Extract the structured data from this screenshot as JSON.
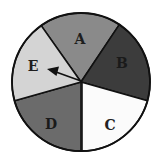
{
  "spinner": {
    "sectors": [
      {
        "label": "A",
        "color": "#8a8a8a",
        "label_color": "#1e1e1e"
      },
      {
        "label": "B",
        "color": "#3c3c3c",
        "label_color": "#1a1a1a"
      },
      {
        "label": "C",
        "color": "#fbfbfb",
        "label_color": "#222222"
      },
      {
        "label": "D",
        "color": "#6b6b6b",
        "label_color": "#1a1a1a"
      },
      {
        "label": "E",
        "color": "#d4d4d4",
        "label_color": "#1e1e1e"
      }
    ],
    "arrow_pointing_to": "E",
    "outline_color": "#111111"
  }
}
